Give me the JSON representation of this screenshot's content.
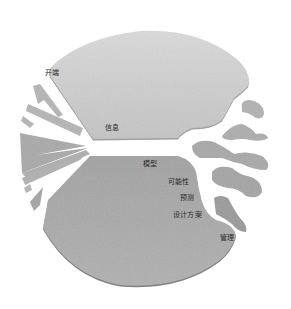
{
  "diagram": {
    "type": "conceptual-circle",
    "regions": {
      "upper": {
        "name": "upper-region",
        "fill": "#cfcfcf",
        "shade": "#b9b9b9"
      },
      "lower": {
        "name": "lower-region",
        "fill": "#a8a8a8",
        "shade": "#8e8e8e"
      },
      "fragments_left": {
        "fill": "#b3b3b3"
      },
      "blobs_right": {
        "fill": "#a9a9a9"
      }
    },
    "labels": [
      {
        "id": "kaiduan",
        "text": "开端",
        "x": 45,
        "y": 70
      },
      {
        "id": "xinxi",
        "text": "信息",
        "x": 105,
        "y": 124
      },
      {
        "id": "moxing",
        "text": "模型",
        "x": 142,
        "y": 160
      },
      {
        "id": "kenengxing",
        "text": "可能性",
        "x": 168,
        "y": 178
      },
      {
        "id": "yuce",
        "text": "预测",
        "x": 178,
        "y": 194
      },
      {
        "id": "shejifangan",
        "text": "设计方案",
        "x": 172,
        "y": 211
      },
      {
        "id": "guanli",
        "text": "管理",
        "x": 219,
        "y": 234
      }
    ]
  }
}
